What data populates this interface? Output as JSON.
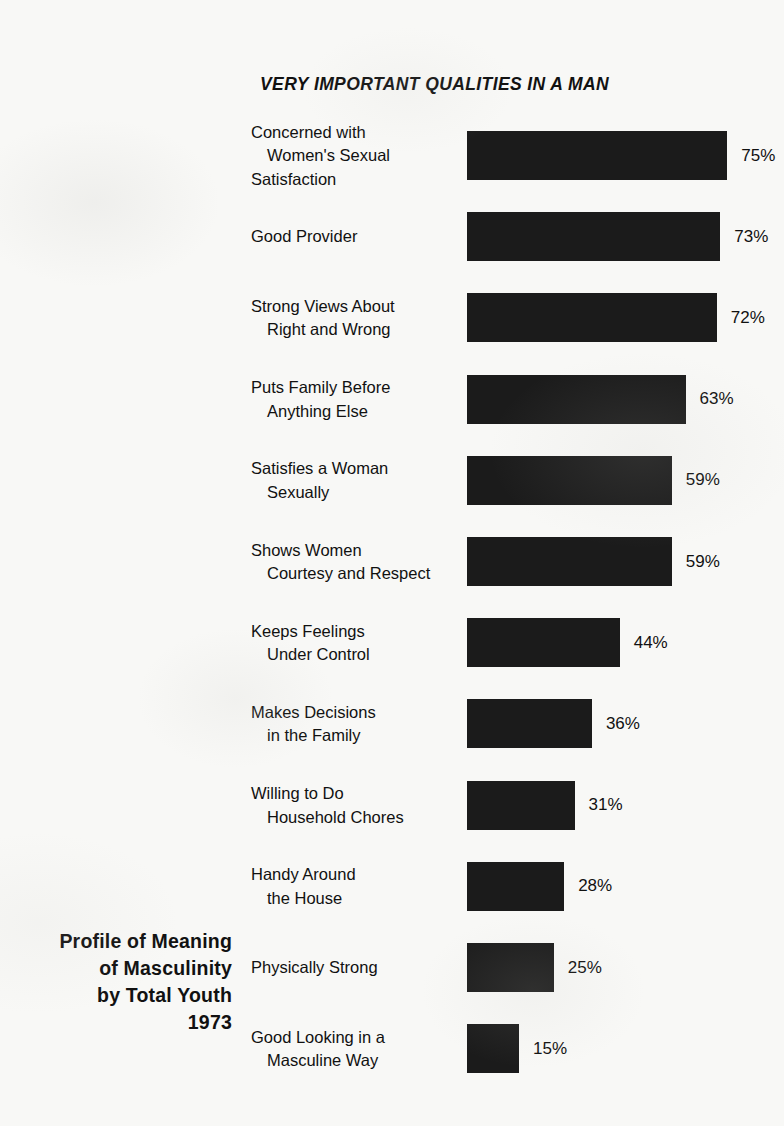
{
  "chart_data": {
    "type": "bar",
    "orientation": "horizontal",
    "title": "VERY IMPORTANT QUALITIES IN A MAN",
    "subtitle": "",
    "xlabel": "",
    "ylabel": "",
    "xlim": [
      0,
      100
    ],
    "grid": false,
    "legend": null,
    "value_suffix": "%",
    "categories": [
      "Concerned with Women's Sexual Satisfaction",
      "Good Provider",
      "Strong Views About Right and Wrong",
      "Puts Family Before Anything Else",
      "Satisfies a Woman Sexually",
      "Shows Women Courtesy and Respect",
      "Keeps Feelings Under Control",
      "Makes Decisions in the Family",
      "Willing to Do Household Chores",
      "Handy Around the House",
      "Physically Strong",
      "Good Looking in a Masculine Way"
    ],
    "values": [
      75,
      73,
      72,
      63,
      59,
      59,
      44,
      36,
      31,
      28,
      25,
      15
    ],
    "bars": [
      {
        "lines": [
          "Concerned with",
          "Women's Sexual",
          "Satisfaction"
        ],
        "value": 75,
        "value_label": "75%"
      },
      {
        "lines": [
          "Good Provider"
        ],
        "value": 73,
        "value_label": "73%"
      },
      {
        "lines": [
          "Strong Views About",
          "Right and Wrong"
        ],
        "value": 72,
        "value_label": "72%"
      },
      {
        "lines": [
          "Puts Family Before",
          "Anything Else"
        ],
        "value": 63,
        "value_label": "63%"
      },
      {
        "lines": [
          "Satisfies a Woman",
          "Sexually"
        ],
        "value": 59,
        "value_label": "59%"
      },
      {
        "lines": [
          "Shows Women",
          "Courtesy and Respect"
        ],
        "value": 59,
        "value_label": "59%"
      },
      {
        "lines": [
          "Keeps Feelings",
          "Under Control"
        ],
        "value": 44,
        "value_label": "44%"
      },
      {
        "lines": [
          "Makes Decisions",
          "in the Family"
        ],
        "value": 36,
        "value_label": "36%"
      },
      {
        "lines": [
          "Willing to Do",
          "Household Chores"
        ],
        "value": 31,
        "value_label": "31%"
      },
      {
        "lines": [
          "Handy Around",
          "the House"
        ],
        "value": 28,
        "value_label": "28%"
      },
      {
        "lines": [
          "Physically Strong"
        ],
        "value": 25,
        "value_label": "25%"
      },
      {
        "lines": [
          "Good Looking in a",
          "Masculine Way"
        ],
        "value": 15,
        "value_label": "15%"
      }
    ],
    "colors": {
      "bar": "#1b1b1b",
      "text": "#111111",
      "background": "#f8f8f6"
    }
  },
  "caption": {
    "lines": [
      "Profile of Meaning",
      "of Masculinity",
      "by Total Youth",
      "1973"
    ]
  }
}
